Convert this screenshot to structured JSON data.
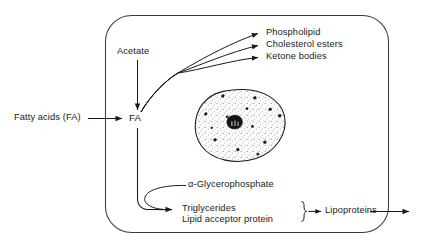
{
  "diagram": {
    "cell_membrane": "cell-boundary",
    "nucleus": "nucleus",
    "labels": {
      "fatty_acids_external": "Fatty acids (FA)",
      "fa_node": "FA",
      "acetate": "Acetate",
      "phospholipid": "Phospholipid",
      "cholesterol_esters": "Cholesterol esters",
      "ketone_bodies": "Ketone bodies",
      "glycerophosphate": "α-Glycerophosphate",
      "triglycerides": "Triglycerides",
      "lipid_acceptor_protein": "Lipid acceptor protein",
      "lipoproteins": "Lipoproteins"
    },
    "colors": {
      "stroke": "#1a1a1a",
      "background": "#ffffff",
      "nucleus_fill": "#fdfdfd"
    }
  }
}
